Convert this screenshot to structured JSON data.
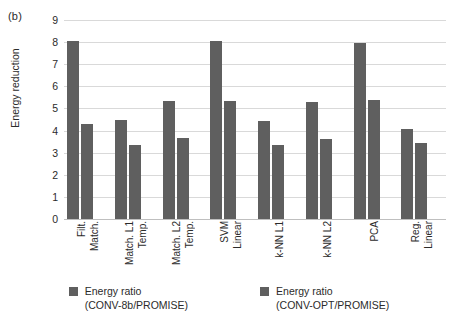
{
  "panel": {
    "tag": "(b)"
  },
  "chart_data": {
    "type": "bar",
    "title": "",
    "xlabel": "",
    "ylabel": "Energy reduction",
    "ylim": [
      0,
      9
    ],
    "yticks": [
      0,
      1,
      2,
      3,
      4,
      5,
      6,
      7,
      8,
      9
    ],
    "ytick_labels": [
      "0",
      "1",
      "2",
      "3",
      "4",
      "5",
      "6",
      "7",
      "8",
      "9"
    ],
    "grid": true,
    "legend_position": "bottom",
    "categories": [
      "Match. Filt.",
      "Temp. Match. L1",
      "Temp. Match. L2",
      "Linear SVM",
      "k-NN L1",
      "k-NN L2",
      "PCA",
      "Linear Reg."
    ],
    "category_lines": [
      [
        "Match.",
        "Filt."
      ],
      [
        "Temp.",
        "Match. L1"
      ],
      [
        "Temp.",
        "Match. L2"
      ],
      [
        "Linear",
        "SVM"
      ],
      [
        "k-NN L1"
      ],
      [
        "k-NN L2"
      ],
      [
        "PCA"
      ],
      [
        "Linear",
        "Reg."
      ]
    ],
    "series": [
      {
        "name": "Energy ratio (CONV-8b/PROMISE)",
        "name_lines": [
          "Energy ratio",
          "(CONV-8b/PROMISE)"
        ],
        "color": "#5f5f5f",
        "values": [
          8.05,
          4.48,
          5.33,
          8.05,
          4.45,
          5.3,
          7.95,
          4.05
        ]
      },
      {
        "name": "Energy ratio (CONV-OPT/PROMISE)",
        "name_lines": [
          "Energy ratio",
          "(CONV-OPT/PROMISE)"
        ],
        "color": "#5f5f5f",
        "values": [
          4.3,
          3.35,
          3.67,
          5.35,
          3.35,
          3.63,
          5.37,
          3.42
        ]
      }
    ]
  }
}
